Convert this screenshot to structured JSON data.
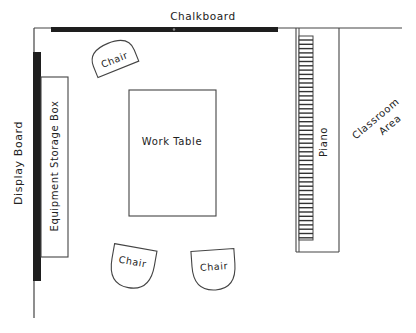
{
  "diagram": {
    "type": "classroom-floor-plan",
    "labels": {
      "chalkboard": "Chalkboard",
      "display_board": "Display Board",
      "equipment_storage_box": "Equipment Storage Box",
      "work_table": "Work Table",
      "piano": "Piano",
      "classroom_area_line1": "Classroom",
      "classroom_area_line2": "Area",
      "chair_1": "Chair",
      "chair_2": "Chair",
      "chair_3": "Chair"
    },
    "colors": {
      "line": "#333333",
      "bar": "#1e1e1e",
      "background": "#ffffff"
    }
  }
}
